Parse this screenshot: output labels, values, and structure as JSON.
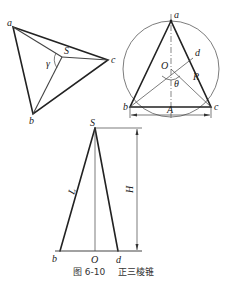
{
  "figure": {
    "caption_number": "图 6-10",
    "caption_title": "正三棱锥"
  },
  "views": {
    "top_left_pyramid": {
      "labels": {
        "a": "a",
        "b": "b",
        "c": "c",
        "S": "S",
        "gamma": "γ"
      }
    },
    "circle_view": {
      "labels": {
        "a": "a",
        "b": "b",
        "c": "c",
        "d": "d",
        "O": "O",
        "R": "R",
        "theta": "θ",
        "A": "A"
      }
    },
    "side_triangle": {
      "labels": {
        "S": "S",
        "b": "b",
        "O": "O",
        "d": "d",
        "L": "L",
        "H": "H"
      }
    }
  },
  "colors": {
    "line": "#222222",
    "background": "#ffffff"
  }
}
